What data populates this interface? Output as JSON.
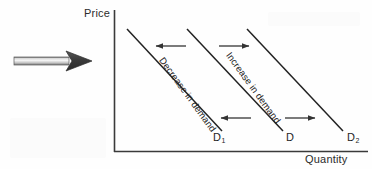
{
  "diagram": {
    "background_color": "#fefefe",
    "axes": {
      "y_label": "Price",
      "x_label": "Quantity",
      "line_color": "#3a3a3a",
      "origin_x": 114,
      "origin_y": 152,
      "y_top": 10,
      "x_right": 368
    },
    "curves": [
      {
        "id": "d1",
        "label": "D",
        "subscript": "1",
        "x1": 127,
        "y1": 29,
        "x2": 222,
        "y2": 131,
        "color": "#222222"
      },
      {
        "id": "d",
        "label": "D",
        "subscript": "",
        "x1": 187,
        "y1": 29,
        "x2": 283,
        "y2": 131,
        "color": "#222222"
      },
      {
        "id": "d2",
        "label": "D",
        "subscript": "2",
        "x1": 247,
        "y1": 29,
        "x2": 343,
        "y2": 131,
        "color": "#222222"
      }
    ],
    "shift_labels": [
      {
        "id": "decrease",
        "text": "Decrease in demand"
      },
      {
        "id": "increase",
        "text": "Increase in demand"
      }
    ],
    "shift_arrows": [
      {
        "id": "decrease-arrow-top",
        "direction": "left",
        "x1": 186,
        "y1": 46,
        "x2": 155,
        "y2": 46,
        "color": "#333333"
      },
      {
        "id": "increase-arrow-top",
        "direction": "right",
        "x1": 219,
        "y1": 46,
        "x2": 250,
        "y2": 46,
        "color": "#333333"
      },
      {
        "id": "decrease-arrow-bottom",
        "direction": "left",
        "x1": 251,
        "y1": 118,
        "x2": 220,
        "y2": 118,
        "color": "#333333"
      },
      {
        "id": "increase-arrow-bottom",
        "direction": "right",
        "x1": 285,
        "y1": 118,
        "x2": 316,
        "y2": 118,
        "color": "#333333"
      }
    ],
    "pointer_arrow": {
      "id": "pointer-block-arrow",
      "direction": "right",
      "shaft_x": 14,
      "shaft_y": 57,
      "shaft_width": 54,
      "shaft_height": 8,
      "head_tip_x": 92,
      "head_y": 61,
      "head_height": 20,
      "shaft_color_light": "#f2f2f2",
      "shaft_color_mid": "#b9b9b9",
      "shaft_color_dark": "#6e6e6e",
      "head_color": "#3c3c3c"
    }
  }
}
